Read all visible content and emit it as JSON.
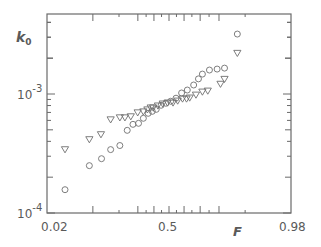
{
  "chart_data": {
    "type": "scatter",
    "title": "",
    "xlabel": "F",
    "ylabel": "k0",
    "ylabel_main": "k",
    "ylabel_sub": "0",
    "x_scale": "probability (normal)",
    "y_scale": "log",
    "xlim": [
      0.02,
      0.98
    ],
    "ylim": [
      0.0001,
      0.0047
    ],
    "x_tick_labels": [
      "0.02",
      "0.5",
      "0.98"
    ],
    "y_tick_labels": [
      {
        "base": "10",
        "exp": "-3",
        "value": 0.001
      },
      {
        "base": "10",
        "exp": "-4",
        "value": 0.0001
      }
    ],
    "grid": false,
    "legend": "none",
    "series": [
      {
        "name": "circles",
        "marker": "circle",
        "points": [
          [
            0.04,
            0.000157
          ],
          [
            0.09,
            0.00025
          ],
          [
            0.128,
            0.000286
          ],
          [
            0.163,
            0.000341
          ],
          [
            0.204,
            0.000369
          ],
          [
            0.241,
            0.000495
          ],
          [
            0.272,
            0.000556
          ],
          [
            0.304,
            0.000567
          ],
          [
            0.333,
            0.000625
          ],
          [
            0.363,
            0.000688
          ],
          [
            0.389,
            0.000715
          ],
          [
            0.415,
            0.000743
          ],
          [
            0.447,
            0.000804
          ],
          [
            0.479,
            0.000836
          ],
          [
            0.511,
            0.000869
          ],
          [
            0.547,
            0.000922
          ],
          [
            0.584,
            0.00102
          ],
          [
            0.621,
            0.00108
          ],
          [
            0.661,
            0.00119
          ],
          [
            0.69,
            0.00134
          ],
          [
            0.713,
            0.00147
          ],
          [
            0.752,
            0.00159
          ],
          [
            0.791,
            0.00162
          ],
          [
            0.825,
            0.00165
          ],
          [
            0.875,
            0.00319
          ]
        ]
      },
      {
        "name": "triangles",
        "marker": "triangle-down",
        "points": [
          [
            0.04,
            0.000341
          ],
          [
            0.09,
            0.000414
          ],
          [
            0.126,
            0.000456
          ],
          [
            0.163,
            0.000608
          ],
          [
            0.204,
            0.000632
          ],
          [
            0.229,
            0.000632
          ],
          [
            0.26,
            0.000645
          ],
          [
            0.299,
            0.000696
          ],
          [
            0.333,
            0.000709
          ],
          [
            0.358,
            0.000737
          ],
          [
            0.379,
            0.000765
          ],
          [
            0.395,
            0.000765
          ],
          [
            0.426,
            0.000795
          ],
          [
            0.458,
            0.000826
          ],
          [
            0.49,
            0.000842
          ],
          [
            0.527,
            0.000842
          ],
          [
            0.558,
            0.000874
          ],
          [
            0.59,
            0.000909
          ],
          [
            0.616,
            0.000909
          ],
          [
            0.636,
            0.000927
          ],
          [
            0.675,
            0.000981
          ],
          [
            0.713,
            0.00104
          ],
          [
            0.743,
            0.00106
          ],
          [
            0.807,
            0.00121
          ],
          [
            0.825,
            0.00133
          ],
          [
            0.875,
            0.0022
          ]
        ]
      }
    ]
  }
}
